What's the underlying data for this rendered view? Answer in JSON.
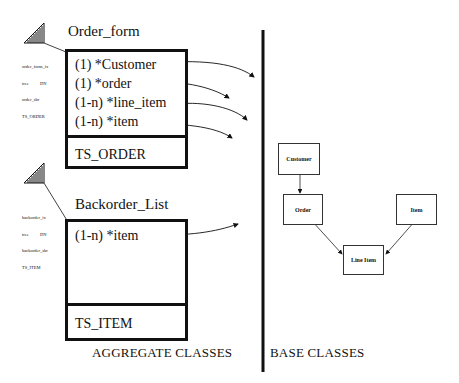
{
  "aggregate": {
    "section_label": "AGGREGATE CLASSES",
    "classes": [
      {
        "name": "Order_form",
        "attributes": [
          "(1) *Customer",
          "(1) *order",
          "(1-n) *line_item",
          "(1-n) *item"
        ],
        "footer": "TS_ORDER",
        "meta": [
          "order_form_ix",
          "tree          DN",
          "order_sbr",
          "TS_ORDER"
        ]
      },
      {
        "name": "Backorder_List",
        "attributes": [
          "(1-n) *item"
        ],
        "footer": "TS_ITEM",
        "meta": [
          "backorder_ix",
          "tree          DN",
          "backorder_sbr",
          "TS_ITEM"
        ]
      }
    ]
  },
  "base": {
    "section_label": "BASE CLASSES",
    "classes": [
      "Customer",
      "Order",
      "Item",
      "Line Item"
    ],
    "relations": [
      {
        "from": "Customer",
        "to": "Order"
      },
      {
        "from": "Order",
        "to": "Line Item"
      },
      {
        "from": "Item",
        "to": "Line Item"
      }
    ]
  },
  "colors": {
    "ink": "#111111",
    "background": "#ffffff"
  }
}
